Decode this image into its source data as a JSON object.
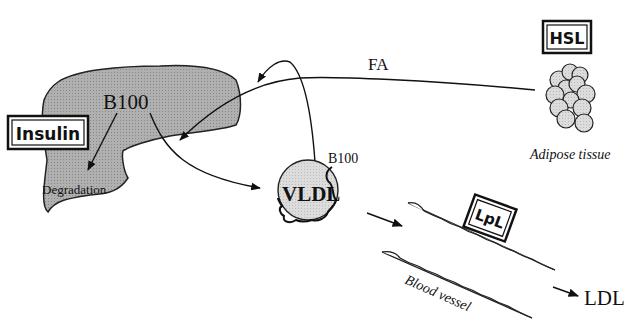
{
  "diagram": {
    "nodes": {
      "liver": {
        "label_apo": "B100",
        "label_degradation": "Degradation"
      },
      "insulin": {
        "label": "Insulin"
      },
      "hsl": {
        "label": "HSL"
      },
      "adipose": {
        "label": "Adipose tissue"
      },
      "vldl": {
        "label": "VLDL",
        "apo_label": "B100"
      },
      "lpl": {
        "label": "LpL"
      },
      "vessel": {
        "label": "Blood vessel"
      },
      "ldl": {
        "label": "LDL"
      }
    },
    "edges": {
      "fa": {
        "label": "FA",
        "from": "adipose",
        "to": "liver"
      },
      "b100_to_degradation": {
        "from": "B100",
        "to": "Degradation"
      },
      "b100_to_vldl": {
        "from": "B100",
        "to": "VLDL"
      },
      "vldl_to_liver": {
        "from": "VLDL",
        "to": "liver"
      },
      "vldl_to_vessel": {
        "from": "VLDL",
        "to": "vessel"
      },
      "vessel_to_ldl": {
        "from": "vessel",
        "to": "LDL"
      }
    },
    "colors": {
      "liver_fill": "#a8a8a8",
      "particle_fill": "#d8d8d8",
      "stroke": "#111111"
    }
  }
}
